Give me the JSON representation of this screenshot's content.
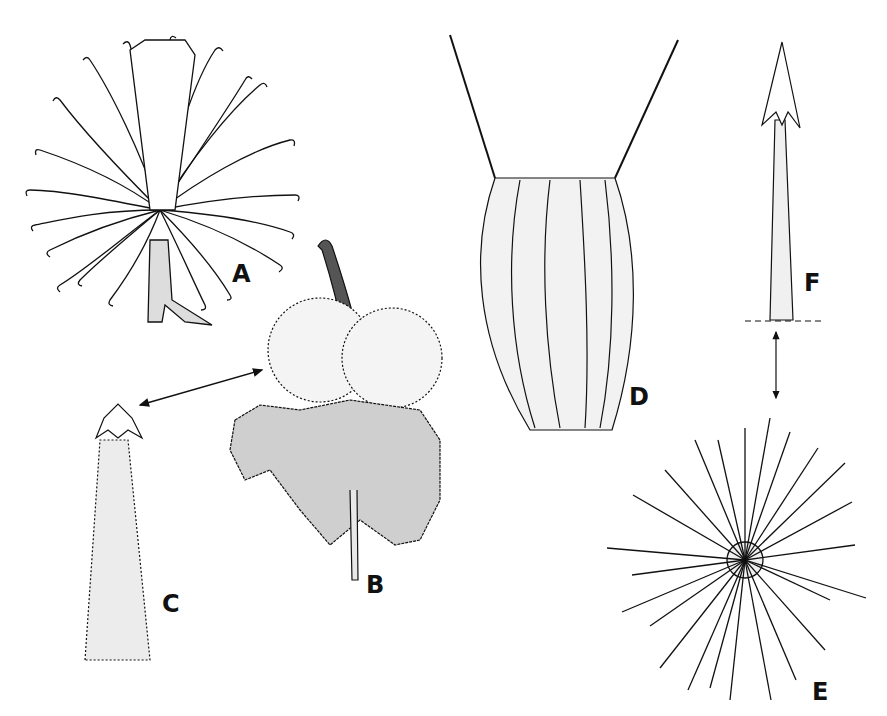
{
  "figure": {
    "background": "#ffffff",
    "ink": "#111111",
    "panels": [
      {
        "id": "A",
        "label": "A",
        "description": "flower head with curled styles"
      },
      {
        "id": "B",
        "label": "B",
        "description": "burr head with hooked bracts"
      },
      {
        "id": "C",
        "label": "C",
        "description": "enlarged bract tip with hook"
      },
      {
        "id": "D",
        "label": "D",
        "description": "bristly achene with two awns"
      },
      {
        "id": "E",
        "label": "E",
        "description": "spiny fruit with barbed spines"
      },
      {
        "id": "F",
        "label": "F",
        "description": "enlarged barbed spine"
      }
    ]
  }
}
